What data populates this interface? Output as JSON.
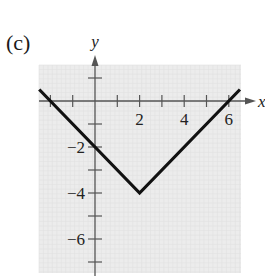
{
  "panel_label": "(c)",
  "chart_data": {
    "type": "line",
    "title": "",
    "panel": "(c)",
    "xlabel": "x",
    "ylabel": "y",
    "function": "y = |x - 2| - 4",
    "x": [
      -2.5,
      2,
      6.5
    ],
    "series": [
      {
        "name": "y = |x-2| - 4",
        "x": [
          -2.5,
          2,
          6.5
        ],
        "y": [
          0.5,
          -4,
          0.5
        ]
      }
    ],
    "key_points": [
      {
        "x": -2,
        "y": 0,
        "label": "x-intercept"
      },
      {
        "x": 0,
        "y": -2,
        "label": "y-intercept"
      },
      {
        "x": 2,
        "y": -4,
        "label": "vertex"
      },
      {
        "x": 6,
        "y": 0,
        "label": "x-intercept"
      }
    ],
    "xlim": [
      -2.5,
      6.5
    ],
    "ylim": [
      -7.5,
      1.6
    ],
    "x_ticks": [
      -2,
      -1,
      1,
      2,
      3,
      4,
      5,
      6
    ],
    "x_tick_labels": [
      "2",
      "4",
      "6"
    ],
    "x_tick_label_values": [
      2,
      4,
      6
    ],
    "y_ticks": [
      1,
      -1,
      -2,
      -3,
      -4,
      -5,
      -6,
      -7
    ],
    "y_tick_labels": [
      "-2",
      "-4",
      "-6"
    ],
    "y_tick_label_values": [
      -2,
      -4,
      -6
    ],
    "grid": true,
    "legend": null,
    "colors": {
      "background": "#ececec",
      "grid": "#e0e0e0",
      "line": "#111111",
      "axis": "#555555"
    }
  }
}
